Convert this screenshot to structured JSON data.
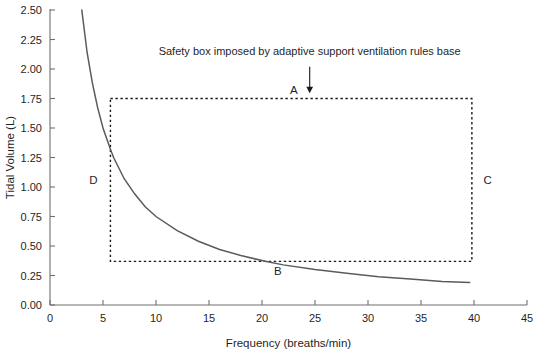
{
  "chart_data": {
    "type": "line",
    "title": "",
    "xlabel": "Frequency (breaths/min)",
    "ylabel": "Tidal Volume (L)",
    "xlim": [
      0,
      45
    ],
    "ylim": [
      0.0,
      2.5
    ],
    "xticks": [
      "0",
      "5",
      "10",
      "15",
      "20",
      "25",
      "30",
      "35",
      "40",
      "45"
    ],
    "xtick_values": [
      0,
      5,
      10,
      15,
      20,
      25,
      30,
      35,
      40,
      45
    ],
    "yticks": [
      "0.00",
      "0.25",
      "0.50",
      "0.75",
      "1.00",
      "1.25",
      "1.50",
      "1.75",
      "2.00",
      "2.25",
      "2.50"
    ],
    "ytick_values": [
      0.0,
      0.25,
      0.5,
      0.75,
      1.0,
      1.25,
      1.5,
      1.75,
      2.0,
      2.25,
      2.5
    ],
    "grid": false,
    "legend": null,
    "series": [
      {
        "name": "Constant minute ventilation isopleth (~7.5 L/min)",
        "relation": "tidal_volume = 7.5 / frequency",
        "x": [
          3.0,
          3.5,
          4.0,
          4.5,
          5.0,
          5.7,
          6.0,
          7.0,
          8.0,
          9.0,
          10.0,
          12.0,
          14.0,
          16.0,
          18.0,
          20.3,
          22.0,
          25.0,
          28.0,
          31.0,
          34.0,
          37.0,
          39.6
        ],
        "y": [
          2.5,
          2.14,
          1.88,
          1.67,
          1.5,
          1.32,
          1.25,
          1.07,
          0.94,
          0.83,
          0.75,
          0.63,
          0.54,
          0.47,
          0.42,
          0.37,
          0.34,
          0.3,
          0.27,
          0.24,
          0.22,
          0.2,
          0.19
        ]
      }
    ],
    "annotations": {
      "callout_text": "Safety box imposed by adaptive support ventilation rules base",
      "callout_text_x": 24.5,
      "callout_text_y": 2.12,
      "arrow_from_x": 24.5,
      "arrow_from_y": 2.02,
      "arrow_to_x": 24.5,
      "arrow_to_y": 1.79
    },
    "safety_box": {
      "label": "Safety box",
      "x_min": 5.7,
      "x_max": 39.8,
      "y_min": 0.37,
      "y_max": 1.75,
      "style": "dashed",
      "corner_labels": [
        {
          "id": "A",
          "text": "A",
          "x": 23.0,
          "y": 1.82,
          "edge": "top"
        },
        {
          "id": "B",
          "text": "B",
          "x": 21.5,
          "y": 0.29,
          "edge": "bottom"
        },
        {
          "id": "C",
          "text": "C",
          "x": 41.3,
          "y": 1.06,
          "edge": "right"
        },
        {
          "id": "D",
          "text": "D",
          "x": 4.1,
          "y": 1.06,
          "edge": "left"
        }
      ]
    },
    "colors": {
      "curve": "#5a5a5f",
      "box": "#1a1a1a",
      "axis": "#6f6f6f",
      "text": "#1f1f1f",
      "background": "#ffffff"
    }
  }
}
